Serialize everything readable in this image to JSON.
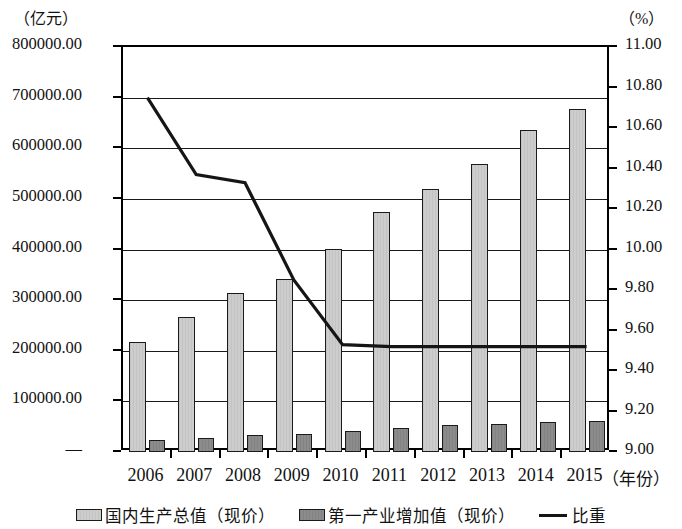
{
  "axis": {
    "left_unit": "（亿元）",
    "right_unit": "（%）",
    "x_axis_title": "（年份）",
    "left_ticks": [
      "800000.00",
      "700000.00",
      "600000.00",
      "500000.00",
      "400000.00",
      "300000.00",
      "200000.00",
      "100000.00",
      "—"
    ],
    "right_ticks": [
      "11.00",
      "10.80",
      "10.60",
      "10.40",
      "10.20",
      "10.00",
      "9.80",
      "9.60",
      "9.40",
      "9.20",
      "9.00"
    ]
  },
  "legend": {
    "items": [
      {
        "label": "国内生产总值（现价）",
        "marker": "gdp-swatch",
        "color": "#cdcdcd"
      },
      {
        "label": "第一产业增加值（现价）",
        "marker": "primary-swatch",
        "color": "#8c8c8c"
      },
      {
        "label": "比重",
        "marker": "line-swatch",
        "color": "#151515"
      }
    ]
  },
  "chart_data": {
    "type": "bar",
    "title": "",
    "xlabel": "（年份）",
    "ylabel": "（亿元）",
    "y2label": "（%）",
    "categories": [
      "2006",
      "2007",
      "2008",
      "2009",
      "2010",
      "2011",
      "2012",
      "2013",
      "2014",
      "2015"
    ],
    "ylim": [
      0,
      800000
    ],
    "y2lim": [
      9.0,
      11.0
    ],
    "ytick_step": 100000,
    "y2tick_step": 0.2,
    "grid": true,
    "legend_position": "bottom",
    "series": [
      {
        "name": "国内生产总值（现价）",
        "type": "bar",
        "axis": "left",
        "color": "#cdcdcd",
        "values": [
          216314,
          265810,
          314045,
          340903,
          401513,
          473104,
          519470,
          568845,
          636463,
          676708
        ]
      },
      {
        "name": "第一产业增加值（现价）",
        "type": "bar",
        "axis": "left",
        "color": "#8c8c8c",
        "values": [
          23317,
          28627,
          33702,
          35226,
          40534,
          47486,
          52374,
          55322,
          58332,
          60863
        ]
      },
      {
        "name": "比重",
        "type": "line",
        "axis": "right",
        "color": "#151515",
        "values": [
          10.75,
          10.37,
          10.33,
          9.85,
          9.53,
          9.52,
          9.52,
          9.52,
          9.52,
          9.52
        ]
      }
    ]
  }
}
